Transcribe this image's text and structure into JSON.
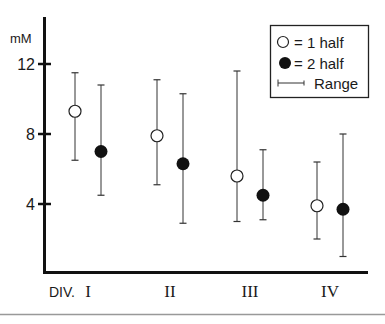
{
  "chart_data": {
    "type": "scatter",
    "title": "",
    "ylabel": "mM",
    "xlabel": "DIV.",
    "categories": [
      "I",
      "II",
      "III",
      "IV"
    ],
    "ylim": [
      0,
      13.5
    ],
    "yticks": [
      4,
      8,
      12
    ],
    "ytick_labels": [
      "4",
      "8",
      "12"
    ],
    "grid": false,
    "legend_position": "top-right",
    "legend": [
      {
        "marker": "open-circle",
        "label": "= 1 half"
      },
      {
        "marker": "filled-circle",
        "label": "= 2 half"
      },
      {
        "marker": "range-bar",
        "label": "Range"
      }
    ],
    "series": [
      {
        "name": "1 half",
        "marker": "open-circle",
        "values": [
          9.3,
          7.9,
          5.6,
          3.9
        ],
        "range_low": [
          6.5,
          5.1,
          3.0,
          2.0
        ],
        "range_high": [
          11.5,
          11.1,
          11.6,
          6.4
        ]
      },
      {
        "name": "2 half",
        "marker": "filled-circle",
        "values": [
          7.0,
          6.3,
          4.5,
          3.7
        ],
        "range_low": [
          4.5,
          2.9,
          3.1,
          1.0
        ],
        "range_high": [
          10.8,
          10.3,
          7.1,
          8.0
        ]
      }
    ]
  }
}
